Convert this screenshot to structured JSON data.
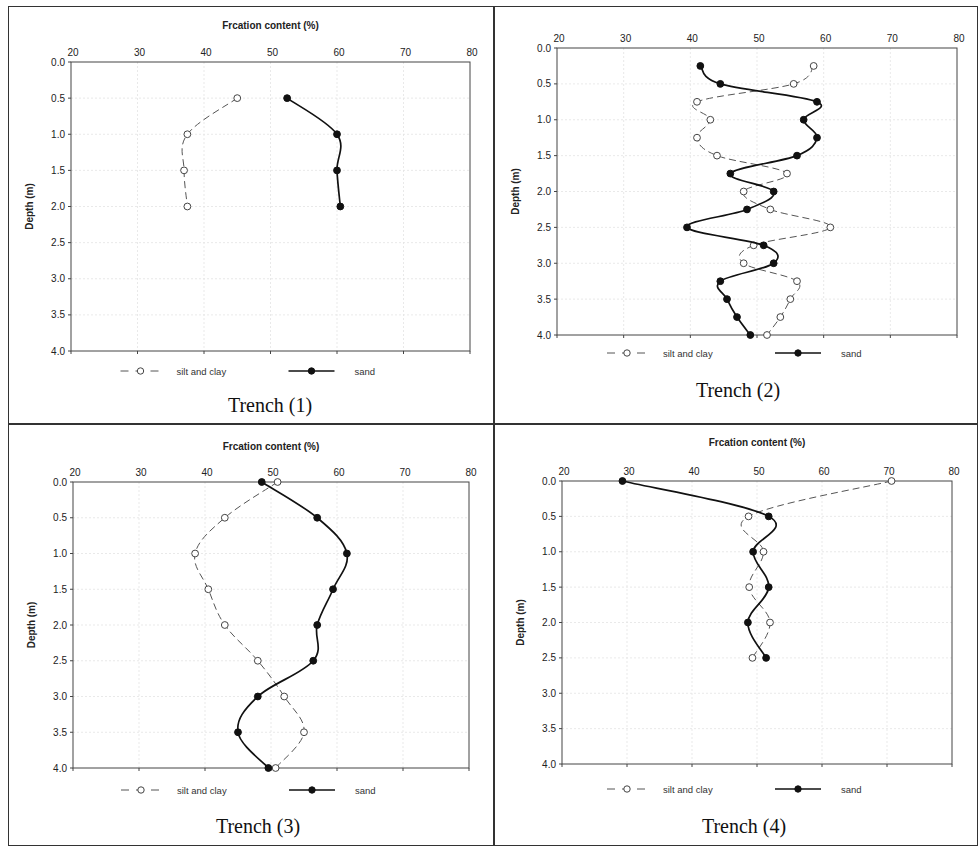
{
  "figure": {
    "panels": [
      {
        "caption": "Trench (1)",
        "show_title": true
      },
      {
        "caption": "Trench (2)",
        "show_title": false
      },
      {
        "caption": "Trench (3)",
        "show_title": true
      },
      {
        "caption": "Trench (4)",
        "show_title": true
      }
    ]
  },
  "chart_data": [
    {
      "type": "line",
      "title": "Frcation content (%)",
      "caption": "Trench (1)",
      "xlabel": "Frcation content (%)",
      "ylabel": "Depth (m)",
      "xlim": [
        20,
        80
      ],
      "ylim": [
        0,
        4.0
      ],
      "y_inverted": true,
      "x_axis_position": "top",
      "x_ticks": [
        20,
        30,
        40,
        50,
        60,
        70,
        80
      ],
      "y_ticks": [
        "0.0",
        "0.5",
        "1.0",
        "1.5",
        "2.0",
        "2.5",
        "3.0",
        "3.5",
        "4.0"
      ],
      "grid": true,
      "legend_position": "bottom",
      "series": [
        {
          "name": "silt and clay",
          "style": "dashed, open circle",
          "points": [
            [
              45,
              0.5
            ],
            [
              37.5,
              1.0
            ],
            [
              37,
              1.5
            ],
            [
              37.5,
              2.0
            ]
          ]
        },
        {
          "name": "sand",
          "style": "solid, filled circle",
          "points": [
            [
              52.5,
              0.5
            ],
            [
              60,
              1.0
            ],
            [
              60,
              1.5
            ],
            [
              60.5,
              2.0
            ]
          ]
        }
      ]
    },
    {
      "type": "line",
      "title": "",
      "caption": "Trench (2)",
      "xlabel": "",
      "ylabel": "Depth (m)",
      "xlim": [
        20,
        80
      ],
      "ylim": [
        0,
        4.0
      ],
      "y_inverted": true,
      "x_axis_position": "top",
      "x_ticks": [
        20,
        30,
        40,
        50,
        60,
        70,
        80
      ],
      "y_ticks": [
        "0.0",
        "0.5",
        "1.0",
        "1.5",
        "2.0",
        "2.5",
        "3.0",
        "3.5",
        "4.0"
      ],
      "grid": true,
      "legend_position": "bottom",
      "series": [
        {
          "name": "silt and clay",
          "style": "dashed, open circle",
          "points": [
            [
              58.5,
              0.25
            ],
            [
              55.5,
              0.5
            ],
            [
              41,
              0.75
            ],
            [
              43,
              1.0
            ],
            [
              41,
              1.25
            ],
            [
              44,
              1.5
            ],
            [
              54.5,
              1.75
            ],
            [
              48,
              2.0
            ],
            [
              52,
              2.25
            ],
            [
              61,
              2.5
            ],
            [
              49.5,
              2.75
            ],
            [
              48,
              3.0
            ],
            [
              56,
              3.25
            ],
            [
              55,
              3.5
            ],
            [
              53.5,
              3.75
            ],
            [
              51.5,
              4.0
            ]
          ]
        },
        {
          "name": "sand",
          "style": "solid, filled circle",
          "points": [
            [
              41.5,
              0.25
            ],
            [
              44.5,
              0.5
            ],
            [
              59,
              0.75
            ],
            [
              57,
              1.0
            ],
            [
              59,
              1.25
            ],
            [
              56,
              1.5
            ],
            [
              46,
              1.75
            ],
            [
              52.5,
              2.0
            ],
            [
              48.5,
              2.25
            ],
            [
              39.5,
              2.5
            ],
            [
              51,
              2.75
            ],
            [
              52.5,
              3.0
            ],
            [
              44.5,
              3.25
            ],
            [
              45.5,
              3.5
            ],
            [
              47,
              3.75
            ],
            [
              49,
              4.0
            ]
          ]
        }
      ]
    },
    {
      "type": "line",
      "title": "Frcation content (%)",
      "caption": "Trench (3)",
      "xlabel": "Frcation content (%)",
      "ylabel": "Depth (m)",
      "xlim": [
        20,
        80
      ],
      "ylim": [
        0,
        4.0
      ],
      "y_inverted": true,
      "x_axis_position": "top",
      "x_ticks": [
        20,
        30,
        40,
        50,
        60,
        70,
        80
      ],
      "y_ticks": [
        "0.0",
        "0.5",
        "1.0",
        "1.5",
        "2.0",
        "2.5",
        "3.0",
        "3.5",
        "4.0"
      ],
      "grid": true,
      "legend_position": "bottom",
      "series": [
        {
          "name": "silt and clay",
          "style": "dashed, open circle",
          "points": [
            [
              51,
              0.0
            ],
            [
              43,
              0.5
            ],
            [
              38.5,
              1.0
            ],
            [
              40.5,
              1.5
            ],
            [
              43,
              2.0
            ],
            [
              48,
              2.5
            ],
            [
              52,
              3.0
            ],
            [
              55,
              3.5
            ],
            [
              50.7,
              4.0
            ]
          ]
        },
        {
          "name": "sand",
          "style": "solid, filled circle",
          "points": [
            [
              48.6,
              0.0
            ],
            [
              57,
              0.5
            ],
            [
              61.5,
              1.0
            ],
            [
              59.4,
              1.5
            ],
            [
              57,
              2.0
            ],
            [
              56.4,
              2.5
            ],
            [
              48,
              3.0
            ],
            [
              45,
              3.5
            ],
            [
              49.6,
              4.0
            ]
          ]
        }
      ]
    },
    {
      "type": "line",
      "title": "Frcation content (%)",
      "caption": "Trench (4)",
      "xlabel": "Frcation content (%)",
      "ylabel": "Depth (m)",
      "xlim": [
        20,
        80
      ],
      "ylim": [
        0,
        4.0
      ],
      "y_inverted": true,
      "x_axis_position": "top",
      "x_ticks": [
        20,
        30,
        40,
        50,
        60,
        70,
        80
      ],
      "y_ticks": [
        "0.0",
        "0.5",
        "1.0",
        "1.5",
        "2.0",
        "2.5",
        "3.0",
        "3.5",
        "4.0"
      ],
      "grid": true,
      "legend_position": "bottom",
      "series": [
        {
          "name": "silt and clay",
          "style": "dashed, open circle",
          "points": [
            [
              70.7,
              0.0
            ],
            [
              48.7,
              0.5
            ],
            [
              51,
              1.0
            ],
            [
              48.8,
              1.5
            ],
            [
              52,
              2.0
            ],
            [
              49.3,
              2.5
            ]
          ]
        },
        {
          "name": "sand",
          "style": "solid, filled circle",
          "points": [
            [
              29.3,
              0.0
            ],
            [
              51.8,
              0.5
            ],
            [
              49.4,
              1.0
            ],
            [
              51.8,
              1.5
            ],
            [
              48.6,
              2.0
            ],
            [
              51.4,
              2.5
            ]
          ]
        }
      ]
    }
  ]
}
